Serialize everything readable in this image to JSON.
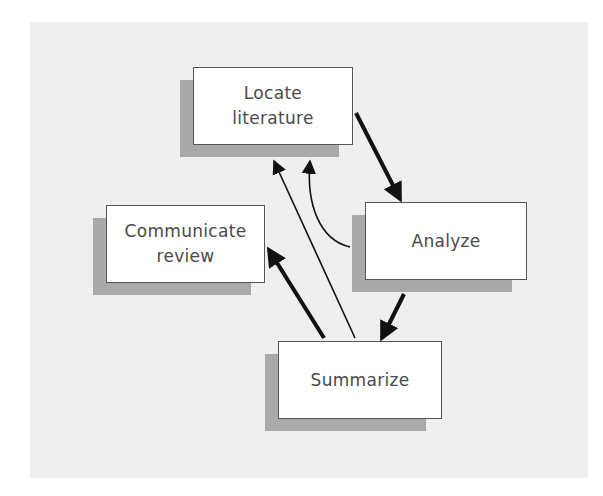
{
  "diagram": {
    "type": "flow-cycle",
    "colors": {
      "background": "#efefef",
      "box_fill": "#ffffff",
      "box_border": "#555555",
      "shadow": "#a9a9a9",
      "text": "#4a4a4a",
      "arrow": "#111111"
    },
    "nodes": [
      {
        "id": "locate",
        "lines": [
          "Locate",
          "literature"
        ]
      },
      {
        "id": "analyze",
        "lines": [
          "Analyze"
        ]
      },
      {
        "id": "communicate",
        "lines": [
          "Communicate",
          "review"
        ]
      },
      {
        "id": "summarize",
        "lines": [
          "Summarize"
        ]
      }
    ],
    "edges": [
      {
        "from": "locate",
        "to": "analyze",
        "style": "thick"
      },
      {
        "from": "analyze",
        "to": "summarize",
        "style": "thick"
      },
      {
        "from": "summarize",
        "to": "communicate",
        "style": "thick"
      },
      {
        "from": "summarize",
        "to": "locate",
        "style": "thin"
      },
      {
        "from": "analyze",
        "to": "locate",
        "style": "thin-curved"
      }
    ]
  }
}
